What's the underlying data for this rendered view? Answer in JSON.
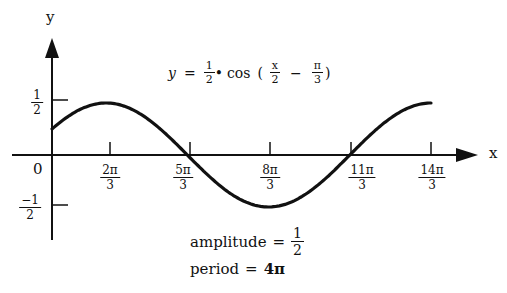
{
  "diagram": {
    "type": "function-graph",
    "equation": {
      "lhs": "y",
      "equals": "=",
      "coef_num": "1",
      "coef_den": "2",
      "dot": "•",
      "func": "cos",
      "open": "(",
      "arg1_num": "x",
      "arg1_den": "2",
      "minus": "−",
      "arg2_num": "π",
      "arg2_den": "3",
      "close": ")"
    },
    "axes": {
      "x_label": "x",
      "y_label": "y",
      "origin_label": "0"
    },
    "y_ticks": [
      {
        "num": "1",
        "den": "2",
        "value": 0.5
      },
      {
        "num": "−1",
        "den": "2",
        "value": -0.5
      }
    ],
    "x_ticks": [
      {
        "num": "2π",
        "den": "3"
      },
      {
        "num": "5π",
        "den": "3"
      },
      {
        "num": "8π",
        "den": "3"
      },
      {
        "num": "11π",
        "den": "3"
      },
      {
        "num": "14π",
        "den": "3"
      }
    ],
    "annotations": {
      "amplitude_label": "amplitude",
      "amplitude_equals": "=",
      "amplitude_num": "1",
      "amplitude_den": "2",
      "period_label": "period",
      "period_equals": "=",
      "period_value": "4π"
    },
    "colors": {
      "stroke": "#111111",
      "background": "#ffffff"
    }
  },
  "chart_data": {
    "type": "line",
    "xlabel": "x",
    "ylabel": "y",
    "x_tick_labels": [
      "2π/3",
      "5π/3",
      "8π/3",
      "11π/3",
      "14π/3"
    ],
    "y_tick_labels": [
      "1/2",
      "−1/2"
    ],
    "series": [
      {
        "name": "y = 1/2 cos(x/2 − π/3)",
        "x": [
          "0",
          "2π/3",
          "5π/3",
          "8π/3",
          "11π/3",
          "14π/3"
        ],
        "values": [
          0.25,
          0.5,
          0,
          -0.5,
          0,
          0.5
        ]
      }
    ],
    "xlim": [
      "0",
      "14π/3"
    ],
    "ylim": [
      -0.5,
      0.5
    ],
    "annotations": [
      "amplitude = 1/2",
      "period = 4π"
    ],
    "grid": false
  }
}
